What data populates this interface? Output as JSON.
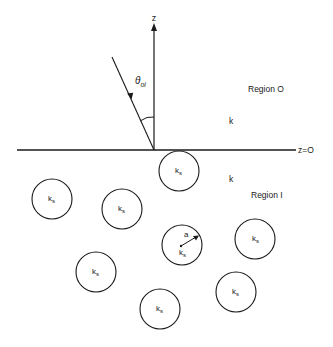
{
  "diagram": {
    "colors": {
      "ink": "#1a1a1a",
      "background": "#ffffff"
    },
    "axis": {
      "label": "z",
      "x": 154,
      "y_bottom": 150,
      "y_top": 25
    },
    "interface": {
      "label": "z=O",
      "y": 150,
      "x_start": 17,
      "x_end": 296
    },
    "incident_ray": {
      "angle_label": "θ",
      "angle_subscript": "oi",
      "from": [
        112,
        57
      ],
      "to": [
        154,
        150
      ]
    },
    "regions": [
      {
        "name": "Region O",
        "wavenumber": "k"
      },
      {
        "name": "Region I",
        "wavenumber": "k"
      }
    ],
    "scatterers": {
      "label": "k",
      "label_subscript": "s",
      "radius_label": "a",
      "radius": 20,
      "circles": [
        {
          "cx": 179,
          "cy": 171
        },
        {
          "cx": 52,
          "cy": 199
        },
        {
          "cx": 122,
          "cy": 209
        },
        {
          "cx": 182,
          "cy": 245,
          "shows_radius": true
        },
        {
          "cx": 255,
          "cy": 239
        },
        {
          "cx": 96,
          "cy": 272
        },
        {
          "cx": 160,
          "cy": 309
        },
        {
          "cx": 236,
          "cy": 292
        }
      ]
    }
  }
}
